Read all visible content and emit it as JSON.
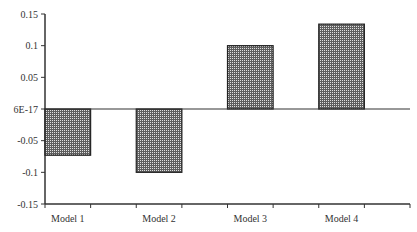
{
  "chart_data": {
    "type": "bar",
    "title": "",
    "xlabel": "",
    "ylabel": "",
    "categories": [
      "Model 1",
      "Model 2",
      "Model 3",
      "Model 4"
    ],
    "values": [
      -0.073,
      -0.1,
      0.1,
      0.134
    ],
    "ylim": [
      -0.15,
      0.15
    ],
    "yticks": [
      0.15,
      0.1,
      0.05,
      0,
      -0.05,
      -0.1,
      -0.15
    ],
    "ytick_labels": [
      "0.15",
      "0.1",
      "0.05",
      "6E-17",
      "-0.05",
      "-0.1",
      "-0.15"
    ],
    "grid": false,
    "legend": null,
    "bar_fill": "crosshatch-dark-gray",
    "colors": {
      "bar_base": "#6a6a6a",
      "bar_dots": "#dcdcdc",
      "bar_border": "#222222",
      "axis": "#333333"
    }
  }
}
